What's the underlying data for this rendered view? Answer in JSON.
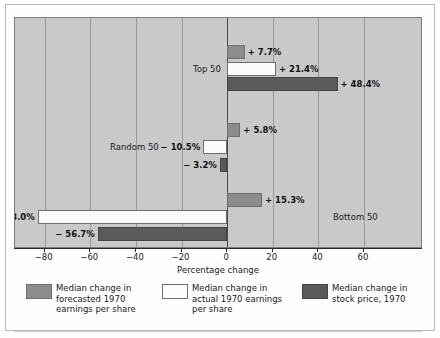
{
  "chart_data": {
    "type": "bar",
    "orientation": "horizontal",
    "title": "",
    "xlabel": "Percentage change",
    "ylabel": "",
    "xlim": [
      -93,
      85
    ],
    "xticks": [
      -80,
      -60,
      -40,
      -20,
      0,
      20,
      40,
      60
    ],
    "xticklabels": [
      "−80",
      "−60",
      "−40",
      "−20",
      "0",
      "20",
      "40",
      "60"
    ],
    "grid": true,
    "grid_axis": "x",
    "legend_position": "below",
    "categories": [
      "Top 50",
      "Random 50",
      "Bottom 50"
    ],
    "series": [
      {
        "name": "Median change in forecasted 1970 earnings per share",
        "color": "#8c8c8c",
        "values": [
          7.7,
          5.8,
          15.3
        ],
        "labels": [
          "+ 7.7%",
          "+ 5.8%",
          "+ 15.3%"
        ]
      },
      {
        "name": "Median change in actual 1970 earnings per share",
        "color": "#fdfdfd",
        "values": [
          21.4,
          -10.5,
          -83.0
        ],
        "labels": [
          "+ 21.4%",
          "− 10.5%",
          "− 83.0%"
        ]
      },
      {
        "name": "Median change in stock price, 1970",
        "color": "#5a5a5a",
        "values": [
          48.4,
          -3.2,
          -56.7
        ],
        "labels": [
          "+ 48.4%",
          "− 3.2%",
          "− 56.7%"
        ]
      }
    ]
  },
  "axis": {
    "title": "Percentage change",
    "ticks": [
      {
        "value": -80,
        "label": "−80"
      },
      {
        "value": -60,
        "label": "−60"
      },
      {
        "value": -40,
        "label": "−40"
      },
      {
        "value": -20,
        "label": "−20"
      },
      {
        "value": 0,
        "label": "0"
      },
      {
        "value": 20,
        "label": "20"
      },
      {
        "value": 40,
        "label": "40"
      },
      {
        "value": 60,
        "label": "60"
      }
    ]
  },
  "groups": [
    {
      "label": "Top 50"
    },
    {
      "label": "Random 50"
    },
    {
      "label": "Bottom 50"
    }
  ],
  "bars": [
    {
      "group": "Top 50",
      "series": "forecast",
      "value": 7.7,
      "label": "+ 7.7%",
      "side": "right"
    },
    {
      "group": "Top 50",
      "series": "actual",
      "value": 21.4,
      "label": "+ 21.4%",
      "side": "right"
    },
    {
      "group": "Top 50",
      "series": "stock",
      "value": 48.4,
      "label": "+ 48.4%",
      "side": "right"
    },
    {
      "group": "Random 50",
      "series": "forecast",
      "value": 5.8,
      "label": "+ 5.8%",
      "side": "right"
    },
    {
      "group": "Random 50",
      "series": "actual",
      "value": -10.5,
      "label": "− 10.5%",
      "side": "left"
    },
    {
      "group": "Random 50",
      "series": "stock",
      "value": -3.2,
      "label": "− 3.2%",
      "side": "left"
    },
    {
      "group": "Bottom 50",
      "series": "forecast",
      "value": 15.3,
      "label": "+ 15.3%",
      "side": "right"
    },
    {
      "group": "Bottom 50",
      "series": "actual",
      "value": -83.0,
      "label": "− 83.0%",
      "side": "left"
    },
    {
      "group": "Bottom 50",
      "series": "stock",
      "value": -56.7,
      "label": "− 56.7%",
      "side": "left"
    }
  ],
  "legend": {
    "items": [
      {
        "swatch": "forecast",
        "color": "#8c8c8c",
        "text": "Median change in\nforecasted 1970\nearnings per share"
      },
      {
        "swatch": "actual",
        "color": "#fdfdfd",
        "text": "Median change in\nactual 1970 earnings\nper share"
      },
      {
        "swatch": "stock",
        "color": "#5a5a5a",
        "text": "Median change in\nstock price, 1970"
      }
    ]
  },
  "colors": {
    "plot_background": "#c9c9c9",
    "page_background": "#fefefe",
    "gridline": "#9a9a9a",
    "axis": "#2a2a2a",
    "forecast": "#8c8c8c",
    "actual": "#fdfdfd",
    "stock": "#5a5a5a"
  }
}
